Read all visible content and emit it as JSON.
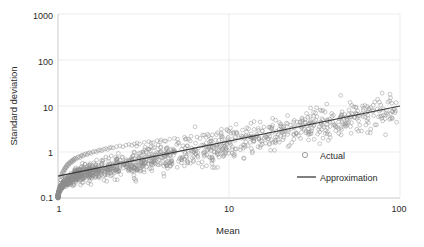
{
  "chart_data": {
    "type": "scatter",
    "title": "",
    "xlabel": "Mean",
    "ylabel": "Standard deviation",
    "xscale": "log",
    "yscale": "log",
    "xlim": [
      1,
      100
    ],
    "ylim": [
      0.1,
      1000
    ],
    "xticks": [
      1,
      10,
      100
    ],
    "xtick_labels": [
      "1",
      "10",
      "100"
    ],
    "yticks": [
      0.1,
      1,
      10,
      100,
      1000
    ],
    "ytick_labels": [
      "0.1",
      "1",
      "10",
      "100",
      "1000"
    ],
    "grid": true,
    "grid_color": "#e8e8e8",
    "legend_position": "lower right",
    "marker_color": "#8c8c8c",
    "marker_style": "open-circle",
    "line_color": "#3a3a3a",
    "series": [
      {
        "name": "Actual",
        "type": "scatter",
        "marker": "open-circle",
        "color": "#8c8c8c",
        "n_points": 1400,
        "description": "Mean vs standard deviation pairs following a power-law relation on log-log axes; dense cluster at low mean rising steeply from (1.02, 0.12), broadening and thinning toward high mean.",
        "points": [
          [
            1.01,
            0.11
          ],
          [
            1.01,
            0.13
          ],
          [
            1.02,
            0.15
          ],
          [
            1.02,
            0.18
          ],
          [
            1.03,
            0.21
          ],
          [
            1.03,
            0.25
          ],
          [
            1.04,
            0.24
          ],
          [
            1.04,
            0.29
          ],
          [
            1.05,
            0.3
          ],
          [
            1.05,
            0.33
          ],
          [
            1.06,
            0.35
          ],
          [
            1.06,
            0.31
          ],
          [
            1.07,
            0.38
          ],
          [
            1.08,
            0.4
          ],
          [
            1.08,
            0.36
          ],
          [
            1.09,
            0.43
          ],
          [
            1.1,
            0.45
          ],
          [
            1.1,
            0.41
          ],
          [
            1.11,
            0.47
          ],
          [
            1.12,
            0.5
          ],
          [
            1.12,
            0.46
          ],
          [
            1.13,
            0.52
          ],
          [
            1.14,
            0.55
          ],
          [
            1.15,
            0.51
          ],
          [
            1.16,
            0.57
          ],
          [
            1.17,
            0.6
          ],
          [
            1.18,
            0.56
          ],
          [
            1.19,
            0.62
          ],
          [
            1.2,
            0.64
          ],
          [
            1.21,
            0.6
          ],
          [
            1.22,
            0.66
          ],
          [
            1.23,
            0.69
          ],
          [
            1.24,
            0.65
          ],
          [
            1.25,
            0.71
          ],
          [
            1.26,
            0.73
          ],
          [
            1.28,
            0.7
          ],
          [
            1.3,
            0.76
          ],
          [
            1.32,
            0.79
          ],
          [
            1.34,
            0.75
          ],
          [
            1.36,
            0.82
          ],
          [
            1.38,
            0.85
          ],
          [
            1.4,
            0.81
          ],
          [
            1.42,
            0.88
          ],
          [
            1.45,
            0.91
          ],
          [
            1.48,
            0.87
          ],
          [
            1.5,
            0.94
          ],
          [
            1.53,
            0.97
          ],
          [
            1.56,
            0.93
          ],
          [
            1.6,
            1.0
          ],
          [
            1.64,
            1.04
          ],
          [
            1.68,
            1.0
          ],
          [
            1.72,
            1.08
          ],
          [
            1.76,
            1.11
          ],
          [
            1.8,
            1.07
          ],
          [
            1.85,
            1.15
          ],
          [
            1.9,
            1.19
          ],
          [
            1.95,
            1.14
          ],
          [
            2.0,
            1.23
          ],
          [
            2.05,
            1.27
          ],
          [
            2.1,
            1.22
          ],
          [
            2.2,
            1.31
          ],
          [
            2.3,
            1.36
          ],
          [
            2.4,
            1.3
          ],
          [
            2.5,
            1.41
          ],
          [
            2.6,
            1.46
          ],
          [
            2.7,
            1.4
          ],
          [
            2.8,
            1.5
          ],
          [
            2.9,
            1.56
          ],
          [
            3.0,
            1.49
          ],
          [
            3.2,
            1.62
          ],
          [
            3.4,
            1.68
          ],
          [
            3.6,
            1.6
          ],
          [
            3.8,
            1.76
          ],
          [
            4.0,
            1.82
          ],
          [
            4.2,
            1.74
          ],
          [
            4.5,
            1.9
          ],
          [
            4.8,
            1.98
          ],
          [
            5.0,
            1.9
          ],
          [
            5.5,
            2.1
          ],
          [
            6.0,
            2.2
          ],
          [
            6.5,
            2.12
          ],
          [
            7.0,
            2.35
          ],
          [
            7.5,
            2.45
          ],
          [
            8.0,
            2.36
          ],
          [
            9.0,
            2.6
          ],
          [
            10.0,
            2.8
          ],
          [
            11.0,
            2.7
          ],
          [
            12.0,
            3.0
          ],
          [
            13.0,
            3.2
          ],
          [
            14.0,
            3.1
          ],
          [
            16.0,
            3.5
          ],
          [
            18.0,
            3.8
          ],
          [
            20.0,
            3.7
          ],
          [
            22.0,
            4.1
          ],
          [
            25.0,
            4.5
          ],
          [
            28.0,
            4.4
          ],
          [
            30.0,
            4.8
          ],
          [
            35.0,
            5.3
          ],
          [
            40.0,
            5.9
          ],
          [
            45.0,
            5.6
          ],
          [
            50.0,
            6.6
          ],
          [
            55.0,
            7.0
          ],
          [
            60.0,
            6.8
          ],
          [
            65.0,
            7.6
          ],
          [
            70.0,
            8.0
          ],
          [
            80.0,
            8.6
          ],
          [
            45.0,
            17.0
          ],
          [
            30.0,
            9.0
          ],
          [
            22.0,
            6.2
          ],
          [
            18.0,
            5.4
          ],
          [
            14.0,
            4.6
          ],
          [
            11.0,
            4.0
          ]
        ]
      },
      {
        "name": "Approximation",
        "type": "line",
        "color": "#3a3a3a",
        "description": "Fitted power-law line on log-log axes passing from about (1, 0.30) to (100, 10.0)",
        "fit": {
          "form": "sigma = a * mean^b",
          "a": 0.3,
          "b": 0.76
        },
        "endpoints": [
          [
            1.0,
            0.3
          ],
          [
            100.0,
            10.0
          ]
        ]
      }
    ],
    "legend_entries": [
      {
        "label": "Actual",
        "marker": "open-circle",
        "color": "#8c8c8c"
      },
      {
        "label": "Approximation",
        "marker": "line",
        "color": "#3a3a3a"
      }
    ]
  }
}
